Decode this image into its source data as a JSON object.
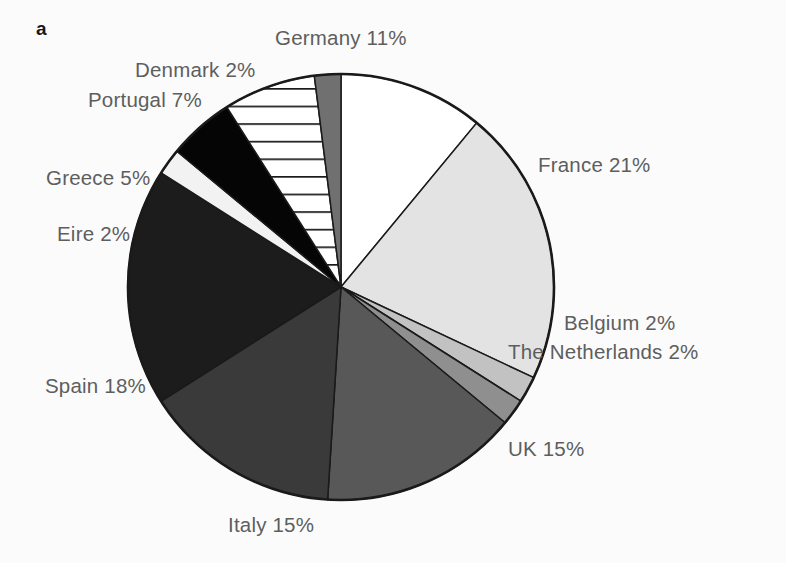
{
  "figure": {
    "panel_label": "a",
    "background_color": "#fbfbfb",
    "label_color": "#5e5e5e",
    "outline_color": "#1a1a1a"
  },
  "labels": {
    "germany": "Germany 11%",
    "denmark": "Denmark 2%",
    "portugal": "Portugal 7%",
    "greece": "Greece 5%",
    "eire": "Eire 2%",
    "spain": "Spain 18%",
    "italy": "Italy 15%",
    "uk": "UK 15%",
    "france": "France 21%",
    "belgium": "Belgium 2%",
    "netherlands": "The Netherlands 2%"
  },
  "chart_data": {
    "type": "pie",
    "title": "",
    "xlabel": "",
    "ylabel": "",
    "legend_position": "outside-labels",
    "grid": false,
    "total": 100,
    "units": "percent",
    "start_angle_deg": 0,
    "direction": "clockwise",
    "center": {
      "x": 341,
      "y": 287
    },
    "radius": 213,
    "categories": [
      "Germany",
      "France",
      "Belgium",
      "The Netherlands",
      "UK",
      "Italy",
      "Spain",
      "Eire",
      "Greece",
      "Portugal",
      "Denmark"
    ],
    "values": [
      11,
      21,
      2,
      2,
      15,
      15,
      18,
      2,
      5,
      7,
      2
    ],
    "slices": [
      {
        "name": "Germany",
        "value": 11,
        "label": "Germany 11%",
        "fill": "#ffffff",
        "pattern": "solid",
        "start_deg": 0,
        "end_deg": 39.6
      },
      {
        "name": "France",
        "value": 21,
        "label": "France 21%",
        "fill": "#e3e3e3",
        "pattern": "solid",
        "start_deg": 39.6,
        "end_deg": 115.2
      },
      {
        "name": "Belgium",
        "value": 2,
        "label": "Belgium 2%",
        "fill": "#c2c2c2",
        "pattern": "solid",
        "start_deg": 115.2,
        "end_deg": 122.4
      },
      {
        "name": "The Netherlands",
        "value": 2,
        "label": "The Netherlands 2%",
        "fill": "#8f8f8f",
        "pattern": "solid",
        "start_deg": 122.4,
        "end_deg": 129.6
      },
      {
        "name": "UK",
        "value": 15,
        "label": "UK 15%",
        "fill": "#585858",
        "pattern": "solid",
        "start_deg": 129.6,
        "end_deg": 183.6
      },
      {
        "name": "Italy",
        "value": 15,
        "label": "Italy 15%",
        "fill": "#3a3a3a",
        "pattern": "solid",
        "start_deg": 183.6,
        "end_deg": 237.6
      },
      {
        "name": "Spain",
        "value": 18,
        "label": "Spain 18%",
        "fill": "#1c1c1c",
        "pattern": "solid",
        "start_deg": 237.6,
        "end_deg": 302.4
      },
      {
        "name": "Eire",
        "value": 2,
        "label": "Eire 2%",
        "fill": "#f2f2f2",
        "pattern": "solid",
        "start_deg": 302.4,
        "end_deg": 309.6
      },
      {
        "name": "Greece",
        "value": 5,
        "label": "Greece 5%",
        "fill": "#050505",
        "pattern": "solid",
        "start_deg": 309.6,
        "end_deg": 327.6
      },
      {
        "name": "Portugal",
        "value": 7,
        "label": "Portugal 7%",
        "fill": "#ffffff",
        "pattern": "horizontal-hatch",
        "start_deg": 327.6,
        "end_deg": 352.8
      },
      {
        "name": "Denmark",
        "value": 2,
        "label": "Denmark 2%",
        "fill": "#707070",
        "pattern": "solid",
        "start_deg": 352.8,
        "end_deg": 360
      }
    ]
  }
}
